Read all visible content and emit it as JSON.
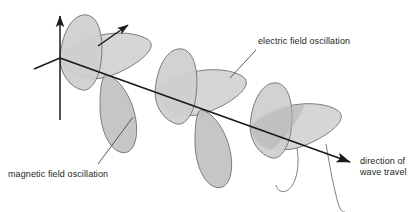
{
  "figure": {
    "type": "physics-diagram",
    "background": "#ffffff"
  },
  "labels": {
    "electric": "electric field oscillation",
    "magnetic": "magnetic field oscillation",
    "direction_line1": "direction of",
    "direction_line2": "wave travel"
  },
  "colors": {
    "stroke": "#3a3a3a",
    "axis": "#1a1a1a",
    "text": "#231f20",
    "lobe_light": "#d6d6d6",
    "lobe_mid": "#c2c2c2",
    "lobe_dark": "#b0b0b0",
    "lobe_edge": "#6f6f6f"
  },
  "geometry": {
    "origin": {
      "x": 60,
      "y": 58
    },
    "axis_end": {
      "x": 353,
      "y": 163
    },
    "vertical_axis_top": {
      "x": 60,
      "y": 13
    },
    "vertical_axis_bottom": {
      "x": 60,
      "y": 120
    },
    "depth_axis_end": {
      "x": 32,
      "y": 70
    },
    "diagonal_arrow_start": {
      "x": 98,
      "y": 46
    },
    "diagonal_arrow_end": {
      "x": 130,
      "y": 24
    },
    "wavelength_px": 95,
    "cycles": 3,
    "electric_amplitude_px": 46,
    "magnetic_amplitude_px": 30
  },
  "annotations": {
    "electric_leader": {
      "x1": 230,
      "y1": 78,
      "x2": 256,
      "y2": 50
    },
    "magnetic_leader": {
      "x1": 98,
      "y1": 164,
      "x2": 133,
      "y2": 117
    }
  }
}
